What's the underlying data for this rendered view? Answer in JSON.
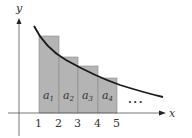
{
  "figure": {
    "axes": {
      "x_label": "x",
      "y_label": "y",
      "tick_labels": [
        "1",
        "2",
        "3",
        "4",
        "5"
      ]
    },
    "rectangles": [
      {
        "label": "a",
        "subscript": "1",
        "from": 1,
        "to": 2
      },
      {
        "label": "a",
        "subscript": "2",
        "from": 2,
        "to": 3
      },
      {
        "label": "a",
        "subscript": "3",
        "from": 3,
        "to": 4
      },
      {
        "label": "a",
        "subscript": "4",
        "from": 4,
        "to": 5
      }
    ],
    "ellipsis": "...",
    "colors": {
      "rect_fill": "#b4b4b4",
      "rect_stroke": "#8a8a8a",
      "curve": "#1a1a1a",
      "axis": "#555555"
    }
  }
}
